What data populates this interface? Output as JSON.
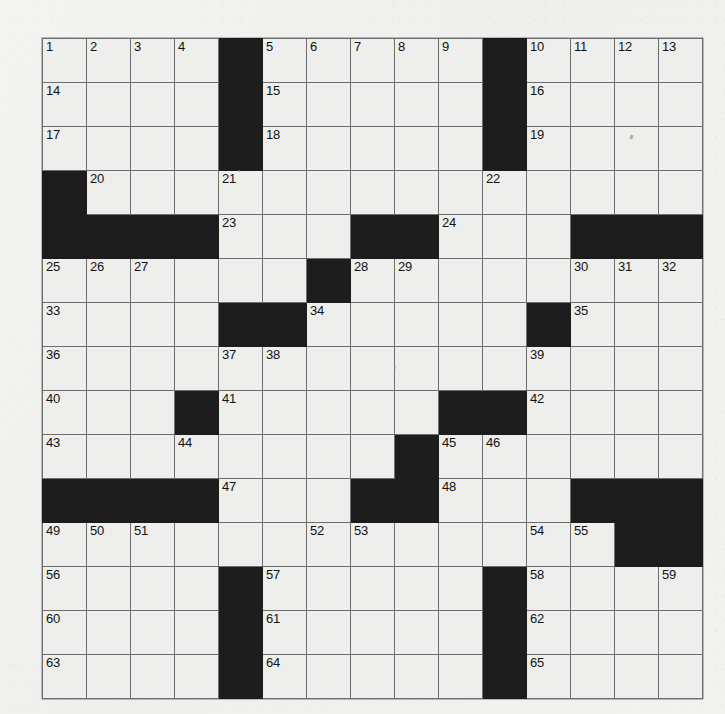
{
  "document": {
    "type": "crossword-puzzle-grid",
    "title": "Crossword Puzzle",
    "columns": 15,
    "rows": 15,
    "background_color": "#f1f1ef",
    "cell_fill_color": "#eeeeec",
    "block_color": "#1c1c1c",
    "grid_line_color": "#6e6e6e",
    "number_color": "#111111",
    "highest_clue_number": 65
  },
  "grid": {
    "legend": {
      "block": "#",
      "open_unnumbered": "",
      "open_numbered": "<number string>"
    },
    "cells": [
      [
        "1",
        "2",
        "3",
        "4",
        "#",
        "5",
        "6",
        "7",
        "8",
        "9",
        "#",
        "10",
        "11",
        "12",
        "13"
      ],
      [
        "14",
        "",
        "",
        "",
        "#",
        "15",
        "",
        "",
        "",
        "",
        "#",
        "16",
        "",
        "",
        ""
      ],
      [
        "17",
        "",
        "",
        "",
        "#",
        "18",
        "",
        "",
        "",
        "",
        "#",
        "19",
        "",
        "",
        ""
      ],
      [
        "#",
        "20",
        "",
        "",
        "21",
        "",
        "",
        "",
        "",
        "",
        "22",
        "",
        "",
        "",
        ""
      ],
      [
        "#",
        "#",
        "#",
        "#",
        "23",
        "",
        "",
        "#",
        "#",
        "24",
        "",
        "",
        "#",
        "#",
        "#"
      ],
      [
        "25",
        "26",
        "27",
        "",
        "",
        "",
        "#",
        "28",
        "29",
        "",
        "",
        "",
        "30",
        "31",
        "32"
      ],
      [
        "33",
        "",
        "",
        "",
        "#",
        "#",
        "34",
        "",
        "",
        "",
        "",
        "#",
        "35",
        "",
        ""
      ],
      [
        "36",
        "",
        "",
        "",
        "37",
        "38",
        "",
        "",
        "",
        "",
        "",
        "39",
        "",
        "",
        ""
      ],
      [
        "40",
        "",
        "",
        "#",
        "41",
        "",
        "",
        "",
        "",
        "#",
        "#",
        "42",
        "",
        "",
        ""
      ],
      [
        "43",
        "",
        "",
        "44",
        "",
        "",
        "",
        "",
        "#",
        "45",
        "46",
        "",
        "",
        "",
        ""
      ],
      [
        "#",
        "#",
        "#",
        "#",
        "47",
        "",
        "",
        "#",
        "#",
        "48",
        "",
        "",
        "#",
        "#",
        "#"
      ],
      [
        "49",
        "50",
        "51",
        "",
        "",
        "",
        "52",
        "53",
        "",
        "",
        "",
        "54",
        "55",
        "#",
        "#"
      ],
      [
        "56",
        "",
        "",
        "",
        "#",
        "57",
        "",
        "",
        "",
        "",
        "#",
        "58",
        "",
        "",
        "59"
      ],
      [
        "60",
        "",
        "",
        "",
        "#",
        "61",
        "",
        "",
        "",
        "",
        "#",
        "62",
        "",
        "",
        ""
      ],
      [
        "63",
        "",
        "",
        "",
        "#",
        "64",
        "",
        "",
        "",
        "",
        "#",
        "65",
        "",
        "",
        ""
      ]
    ]
  },
  "clue_numbers": {
    "across": [
      "1",
      "5",
      "10",
      "14",
      "15",
      "16",
      "17",
      "18",
      "19",
      "20",
      "22",
      "23",
      "24",
      "25",
      "28",
      "30",
      "33",
      "34",
      "35",
      "36",
      "39",
      "40",
      "41",
      "42",
      "43",
      "45",
      "47",
      "48",
      "49",
      "52",
      "54",
      "56",
      "57",
      "58",
      "60",
      "61",
      "62",
      "63",
      "64",
      "65"
    ],
    "down": [
      "1",
      "2",
      "3",
      "4",
      "5",
      "6",
      "7",
      "8",
      "9",
      "10",
      "11",
      "12",
      "13",
      "20",
      "21",
      "22",
      "26",
      "27",
      "29",
      "31",
      "32",
      "34",
      "37",
      "38",
      "44",
      "46",
      "50",
      "51",
      "53",
      "55",
      "59"
    ]
  },
  "entries": []
}
